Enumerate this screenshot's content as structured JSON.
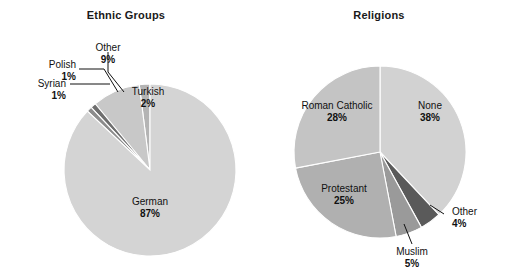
{
  "figure": {
    "width": 505,
    "height": 280,
    "background": "#ffffff"
  },
  "charts": [
    {
      "id": "ethnic",
      "title": "Ethnic Groups",
      "center": {
        "x": 150,
        "y": 170
      },
      "radius": 86,
      "slices": [
        {
          "name": "Turkish",
          "label": "Turkish",
          "pct_text": "2%",
          "value": 2,
          "color": "#b4b4b4"
        },
        {
          "name": "Other",
          "label": "Other",
          "pct_text": "9%",
          "value": 9,
          "color": "#c8c8c8"
        },
        {
          "name": "Polish",
          "label": "Polish",
          "pct_text": "1%",
          "value": 1,
          "color": "#6e6e6e"
        },
        {
          "name": "Syrian",
          "label": "Syrian",
          "pct_text": "1%",
          "value": 1,
          "color": "#8c8c8c"
        },
        {
          "name": "German",
          "label": "German",
          "pct_text": "87%",
          "value": 87,
          "color": "#d4d4d4"
        }
      ]
    },
    {
      "id": "religions",
      "title": "Religions",
      "center": {
        "x": 380,
        "y": 152
      },
      "radius": 86,
      "slices": [
        {
          "name": "None",
          "label": "None",
          "pct_text": "38%",
          "value": 38,
          "color": "#d2d2d2"
        },
        {
          "name": "Other",
          "label": "Other",
          "pct_text": "4%",
          "value": 4,
          "color": "#5a5a5a"
        },
        {
          "name": "Muslim",
          "label": "Muslim",
          "pct_text": "5%",
          "value": 5,
          "color": "#9a9a9a"
        },
        {
          "name": "Protestant",
          "label": "Protestant",
          "pct_text": "25%",
          "value": 25,
          "color": "#b0b0b0"
        },
        {
          "name": "Roman Catholic",
          "label": "Roman Catholic",
          "pct_text": "28%",
          "value": 28,
          "color": "#c4c4c4"
        }
      ]
    }
  ],
  "ethnic": {
    "title": "Ethnic Groups",
    "labels": {
      "german": {
        "name": "German",
        "pct": "87%"
      },
      "turkish": {
        "name": "Turkish",
        "pct": "2%"
      },
      "other": {
        "name": "Other",
        "pct": "9%"
      },
      "polish": {
        "name": "Polish",
        "pct": "1%"
      },
      "syrian": {
        "name": "Syrian",
        "pct": "1%"
      }
    }
  },
  "religions": {
    "title": "Religions",
    "labels": {
      "none": {
        "name": "None",
        "pct": "38%"
      },
      "roman_catholic": {
        "name": "Roman Catholic",
        "pct": "28%"
      },
      "protestant": {
        "name": "Protestant",
        "pct": "25%"
      },
      "muslim": {
        "name": "Muslim",
        "pct": "5%"
      },
      "other": {
        "name": "Other",
        "pct": "4%"
      }
    }
  },
  "chart_data": [
    {
      "type": "pie",
      "title": "Ethnic Groups",
      "xlabel": "",
      "ylabel": "",
      "legend": "none",
      "labels_placement": "inside-and-leader-lines",
      "categories": [
        "German",
        "Other",
        "Turkish",
        "Polish",
        "Syrian"
      ],
      "values": [
        87,
        9,
        2,
        1,
        1
      ],
      "units": "percent",
      "colors": [
        "#d4d4d4",
        "#c8c8c8",
        "#b4b4b4",
        "#6e6e6e",
        "#8c8c8c"
      ],
      "start_angle_deg": 90,
      "direction": "counterclockwise",
      "annotations": [
        "German 87%",
        "Other 9%",
        "Turkish 2%",
        "Polish 1%",
        "Syrian 1%"
      ]
    },
    {
      "type": "pie",
      "title": "Religions",
      "xlabel": "",
      "ylabel": "",
      "legend": "none",
      "labels_placement": "inside-and-leader-lines",
      "categories": [
        "None",
        "Roman Catholic",
        "Protestant",
        "Muslim",
        "Other"
      ],
      "values": [
        38,
        28,
        25,
        5,
        4
      ],
      "units": "percent",
      "colors": [
        "#d2d2d2",
        "#c4c4c4",
        "#b0b0b0",
        "#9a9a9a",
        "#5a5a5a"
      ],
      "start_angle_deg": 90,
      "direction": "clockwise",
      "annotations": [
        "None 38%",
        "Roman Catholic 28%",
        "Protestant 25%",
        "Muslim 5%",
        "Other 4%"
      ]
    }
  ]
}
